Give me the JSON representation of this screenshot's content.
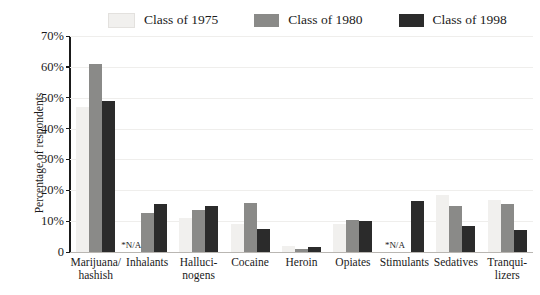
{
  "chart_data": {
    "type": "bar",
    "title": "",
    "xlabel": "",
    "ylabel": "Percentage of respondents",
    "ylim": [
      0,
      70
    ],
    "yticks": [
      0,
      10,
      20,
      30,
      40,
      50,
      60,
      70
    ],
    "ytick_labels": [
      "0",
      "10%",
      "20%",
      "30%",
      "40%",
      "50%",
      "60%",
      "70%"
    ],
    "grid": true,
    "legend_position": "top",
    "na_label": "*N/A",
    "categories": [
      "Marijuana/ hashish",
      "Inhalants",
      "Halluci- nogens",
      "Cocaine",
      "Heroin",
      "Opiates",
      "Stimulants",
      "Sedatives",
      "Tranqui- lizers"
    ],
    "category_lines": [
      [
        "Marijuana/",
        "hashish"
      ],
      [
        "Inhalants"
      ],
      [
        "Halluci-",
        "nogens"
      ],
      [
        "Cocaine"
      ],
      [
        "Heroin"
      ],
      [
        "Opiates"
      ],
      [
        "Stimulants"
      ],
      [
        "Sedatives"
      ],
      [
        "Tranqui-",
        "lizers"
      ]
    ],
    "series": [
      {
        "name": "Class of 1975",
        "color": "#f1f0ee",
        "values": [
          47,
          null,
          11,
          9,
          2,
          9,
          null,
          18.5,
          17
        ]
      },
      {
        "name": "Class of 1980",
        "color": "#8a8a88",
        "values": [
          61,
          12.5,
          13.5,
          16,
          1,
          10.5,
          null,
          15,
          15.5
        ]
      },
      {
        "name": "Class of 1998",
        "color": "#2b2b2b",
        "values": [
          49,
          15.5,
          15,
          7.5,
          1.5,
          10,
          16.5,
          8.5,
          7
        ]
      }
    ]
  },
  "legend": {
    "items": [
      {
        "label": "Class of 1975",
        "color": "#f1f0ee"
      },
      {
        "label": "Class of 1980",
        "color": "#8a8a88"
      },
      {
        "label": "Class of 1998",
        "color": "#2b2b2b"
      }
    ]
  },
  "axis": {
    "y_title": "Percentage of respondents"
  }
}
